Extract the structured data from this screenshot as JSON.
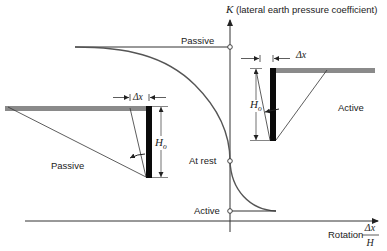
{
  "diagram": {
    "y_axis": {
      "symbol": "K",
      "label": " (lateral earth pressure coefficient)"
    },
    "x_axis": {
      "label": "Rotation",
      "fraction_numerator": "Δx",
      "fraction_denominator": "H"
    },
    "levels": [
      {
        "name": "passive",
        "label": "Passive"
      },
      {
        "name": "at-rest",
        "label": "At rest"
      },
      {
        "name": "active",
        "label": "Active"
      }
    ],
    "left_inset": {
      "label": "Passive",
      "displacement_label": "Δx",
      "height_label_main": "H",
      "height_label_sub": "o"
    },
    "right_inset": {
      "label": "Active",
      "displacement_label": "Δx",
      "height_label_main": "H",
      "height_label_sub": "o"
    },
    "colors": {
      "line": "#333333",
      "wall": "#0a0a0a",
      "soil": "#8a8a8a"
    }
  }
}
